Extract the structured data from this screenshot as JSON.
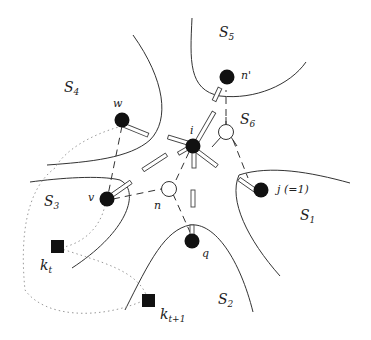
{
  "regions": [
    {
      "id": "S1",
      "base": "S",
      "sub": "1"
    },
    {
      "id": "S2",
      "base": "S",
      "sub": "2"
    },
    {
      "id": "S3",
      "base": "S",
      "sub": "3"
    },
    {
      "id": "S4",
      "base": "S",
      "sub": "4"
    },
    {
      "id": "S5",
      "base": "S",
      "sub": "5"
    },
    {
      "id": "S6",
      "base": "S",
      "sub": "6"
    }
  ],
  "nodes": [
    {
      "id": "w",
      "label": "w",
      "type": "filled-circle"
    },
    {
      "id": "n_prime",
      "label": "n'",
      "type": "filled-circle"
    },
    {
      "id": "i",
      "label": "i",
      "type": "filled-circle"
    },
    {
      "id": "v",
      "label": "v",
      "type": "filled-circle"
    },
    {
      "id": "n",
      "label": "n",
      "type": "open-circle"
    },
    {
      "id": "s6_node",
      "label": "",
      "type": "open-circle"
    },
    {
      "id": "j",
      "label": "j (=1)",
      "type": "filled-circle"
    },
    {
      "id": "q",
      "label": "q",
      "type": "filled-circle"
    },
    {
      "id": "k_t",
      "base": "k",
      "sub": "t",
      "type": "filled-square"
    },
    {
      "id": "k_t1",
      "base": "k",
      "sub": "t+1",
      "type": "filled-square"
    }
  ]
}
